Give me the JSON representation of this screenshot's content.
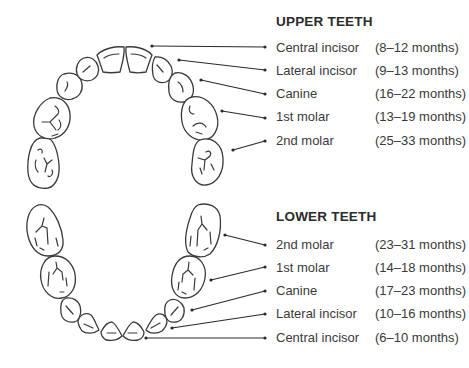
{
  "upper": {
    "title": "UPPER TEETH",
    "items": [
      {
        "name": "Central incisor",
        "months": "(8–12 months)"
      },
      {
        "name": "Lateral incisor",
        "months": "(9–13 months)"
      },
      {
        "name": "Canine",
        "months": "(16–22 months)"
      },
      {
        "name": "1st molar",
        "months": "(13–19 months)"
      },
      {
        "name": "2nd molar",
        "months": "(25–33 months)"
      }
    ]
  },
  "lower": {
    "title": "LOWER TEETH",
    "items": [
      {
        "name": "2nd molar",
        "months": "(23–31 months)"
      },
      {
        "name": "1st molar",
        "months": "(14–18 months)"
      },
      {
        "name": "Canine",
        "months": "(17–23 months)"
      },
      {
        "name": "Lateral incisor",
        "months": "(10–16 months)"
      },
      {
        "name": "Central incisor",
        "months": "(6–10 months)"
      }
    ]
  },
  "colors": {
    "outline": "#3a3a3a",
    "text": "#333333",
    "background": "#ffffff"
  }
}
